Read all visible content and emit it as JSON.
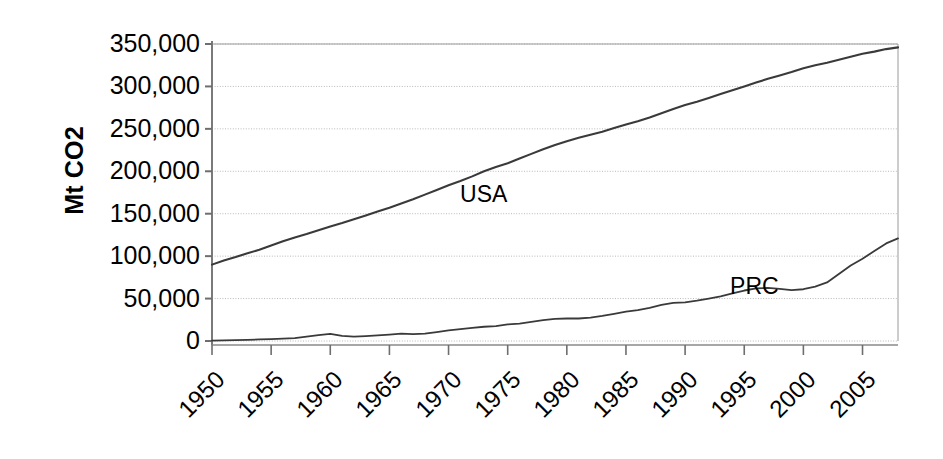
{
  "chart_data": {
    "type": "line",
    "title": "",
    "subtitle": "",
    "xlabel": "",
    "ylabel": "Mt CO2",
    "xlim": [
      1950,
      2008
    ],
    "ylim": [
      0,
      350000
    ],
    "grid": true,
    "legend_position": "inline-annotation",
    "y_ticks": [
      0,
      50000,
      100000,
      150000,
      200000,
      250000,
      300000,
      350000
    ],
    "y_tick_labels": [
      "0",
      "50,000",
      "100,000",
      "150,000",
      "200,000",
      "250,000",
      "300,000",
      "350,000"
    ],
    "x_ticks": [
      1950,
      1955,
      1960,
      1965,
      1970,
      1975,
      1980,
      1985,
      1990,
      1995,
      2000,
      2005
    ],
    "x_tick_labels": [
      "1950",
      "1955",
      "1960",
      "1965",
      "1970",
      "1975",
      "1980",
      "1985",
      "1990",
      "1995",
      "2000",
      "2005"
    ],
    "annotations": [
      {
        "text": "USA",
        "x": 1973,
        "y": 172000
      },
      {
        "text": "PRC",
        "x": 1996,
        "y": 64000
      }
    ],
    "x": [
      1950,
      1951,
      1952,
      1953,
      1954,
      1955,
      1956,
      1957,
      1958,
      1959,
      1960,
      1961,
      1962,
      1963,
      1964,
      1965,
      1966,
      1967,
      1968,
      1969,
      1970,
      1971,
      1972,
      1973,
      1974,
      1975,
      1976,
      1977,
      1978,
      1979,
      1980,
      1981,
      1982,
      1983,
      1984,
      1985,
      1986,
      1987,
      1988,
      1989,
      1990,
      1991,
      1992,
      1993,
      1994,
      1995,
      1996,
      1997,
      1998,
      1999,
      2000,
      2001,
      2002,
      2003,
      2004,
      2005,
      2006,
      2007,
      2008
    ],
    "series": [
      {
        "name": "USA",
        "color": "#3a3a3a",
        "values": [
          90000,
          95000,
          99000,
          103500,
          107500,
          112500,
          117500,
          122000,
          126000,
          130500,
          135000,
          139000,
          143500,
          148000,
          152500,
          157000,
          162000,
          167000,
          172500,
          178000,
          183500,
          188500,
          194000,
          200000,
          205000,
          209500,
          215000,
          220500,
          226000,
          231000,
          235500,
          239500,
          243000,
          246500,
          251000,
          255000,
          259000,
          263500,
          268500,
          273500,
          278000,
          282000,
          286500,
          291000,
          295500,
          300000,
          304500,
          309000,
          313000,
          317000,
          321500,
          325000,
          328000,
          331500,
          335000,
          338500,
          341000,
          344000,
          346000
        ]
      },
      {
        "name": "PRC",
        "color": "#3a3a3a",
        "values": [
          500,
          700,
          1000,
          1400,
          1800,
          2200,
          2800,
          3400,
          5200,
          7000,
          8500,
          6000,
          5200,
          5800,
          6600,
          7600,
          8800,
          8200,
          8600,
          10500,
          12500,
          14000,
          15500,
          16800,
          17500,
          19500,
          20500,
          22500,
          24500,
          26000,
          26500,
          26500,
          27500,
          29500,
          32000,
          34500,
          36500,
          39000,
          42500,
          45000,
          45500,
          47500,
          50000,
          52500,
          56000,
          59500,
          62000,
          62500,
          61500,
          60000,
          61000,
          64000,
          69000,
          79000,
          89000,
          97000,
          106000,
          115000,
          121000
        ]
      }
    ]
  },
  "axes": {
    "y_title": "Mt CO2"
  }
}
